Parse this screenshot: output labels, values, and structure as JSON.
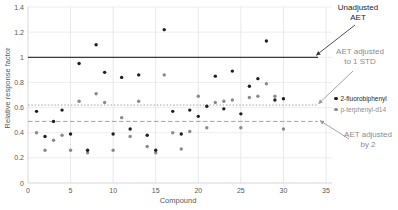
{
  "chart_data": {
    "type": "scatter",
    "title": "",
    "xlabel": "Compound",
    "ylabel": "Relative response factor",
    "xlim": [
      0,
      35
    ],
    "ylim": [
      0,
      1.4
    ],
    "grid": true,
    "x_ticks": [
      "0",
      "5",
      "10",
      "15",
      "20",
      "25",
      "30",
      "35"
    ],
    "y_ticks": [
      "0",
      "0.2",
      "0.4",
      "0.6",
      "0.8",
      "1",
      "1.2",
      "1.4"
    ],
    "legend_position": "right",
    "x": [
      1,
      2,
      3,
      4,
      5,
      6,
      7,
      8,
      9,
      10,
      11,
      12,
      13,
      14,
      15,
      16,
      17,
      18,
      19,
      20,
      21,
      22,
      23,
      24,
      25,
      26,
      27,
      28,
      29,
      30
    ],
    "series": [
      {
        "name": "2-fluorobiphenyl",
        "marker": "dot",
        "color": "#1f1f1f",
        "label_color": "#262626",
        "values": [
          0.57,
          0.37,
          0.49,
          0.58,
          0.39,
          0.95,
          0.26,
          1.1,
          0.88,
          0.39,
          0.84,
          0.43,
          0.86,
          0.38,
          0.26,
          1.22,
          0.57,
          0.39,
          0.58,
          0.53,
          0.61,
          0.85,
          0.59,
          0.89,
          0.55,
          0.77,
          0.83,
          1.13,
          0.66,
          0.67
        ]
      },
      {
        "name": "p-terphenyl-d14",
        "marker": "dot",
        "color": "#8a8a8a",
        "label_color": "#8c8c8c",
        "values": [
          0.4,
          0.26,
          0.34,
          0.38,
          0.26,
          0.65,
          0.24,
          0.71,
          0.64,
          0.26,
          0.52,
          0.37,
          0.65,
          0.29,
          0.24,
          0.86,
          0.4,
          0.27,
          0.41,
          0.69,
          0.44,
          0.64,
          0.65,
          0.66,
          0.44,
          0.68,
          0.69,
          0.79,
          0.69,
          0.43
        ]
      }
    ],
    "reference_lines": [
      {
        "label": "Unadjusted AET",
        "value": 1.0,
        "style": "solid",
        "color": "#3a3a3a"
      },
      {
        "label": "AET adjusted to 1 STD",
        "value": 0.62,
        "style": "dotted",
        "color": "#a3a3a3"
      },
      {
        "label": "AET adjusted by 2",
        "value": 0.49,
        "style": "dashed",
        "color": "#a3a3a3"
      }
    ],
    "annotations": {
      "unadjusted": {
        "line1": "Unadjusted",
        "line2": "AET"
      },
      "one_std": {
        "line1": "AET adjusted",
        "line2": "to 1 STD"
      },
      "by2": {
        "line1": "AET adjusted",
        "line2": "by 2"
      }
    }
  }
}
